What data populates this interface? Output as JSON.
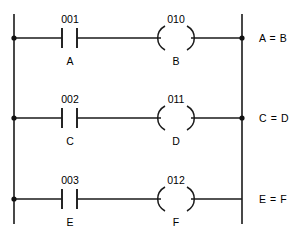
{
  "diagram": {
    "kind": "plc-ladder-logic",
    "stroke_color": "#1a1a1a",
    "text_color": "#000000",
    "background_color": "#ffffff",
    "left_rail_label": "",
    "right_rail_label": "",
    "rungs": [
      {
        "contact": {
          "address": "001",
          "name": "A",
          "type": "normally-open-contact"
        },
        "coil": {
          "address": "010",
          "name": "B",
          "type": "output-coil"
        },
        "equation": "A = B",
        "left_junction": true,
        "right_junction": true
      },
      {
        "contact": {
          "address": "002",
          "name": "C",
          "type": "normally-open-contact"
        },
        "coil": {
          "address": "011",
          "name": "D",
          "type": "output-coil"
        },
        "equation": "C = D",
        "left_junction": true,
        "right_junction": true
      },
      {
        "contact": {
          "address": "003",
          "name": "E",
          "type": "normally-open-contact"
        },
        "coil": {
          "address": "012",
          "name": "F",
          "type": "output-coil"
        },
        "equation": "E = F",
        "left_junction": true,
        "right_junction": false
      }
    ]
  }
}
